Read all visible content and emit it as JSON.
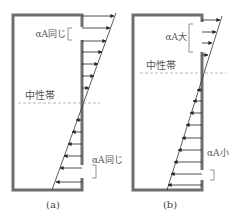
{
  "figure": {
    "panels": [
      {
        "id": "a",
        "caption": "(a)",
        "upper_opening_label": "αA同じ",
        "lower_opening_label": "αA同じ",
        "neutral_zone_label": "中性帯"
      },
      {
        "id": "b",
        "caption": "(b)",
        "upper_opening_label": "αA大",
        "lower_opening_label": "αA小",
        "neutral_zone_label": "中性帯"
      }
    ]
  },
  "colors": {
    "wall": "#6e6e6e",
    "line": "#333333",
    "label": "#555555",
    "dashed": "#888888"
  }
}
